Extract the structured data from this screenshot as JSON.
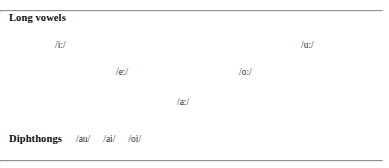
{
  "figure": {
    "long_vowels": {
      "heading": "Long vowels",
      "items": [
        {
          "symbol": "/i:/",
          "x": 55,
          "y": 40
        },
        {
          "symbol": "/u:/",
          "x": 301,
          "y": 40
        },
        {
          "symbol": "/e:/",
          "x": 116,
          "y": 67
        },
        {
          "symbol": "/o:/",
          "x": 239,
          "y": 67
        },
        {
          "symbol": "/a:/",
          "x": 177,
          "y": 97
        }
      ]
    },
    "diphthongs": {
      "heading": "Diphthongs",
      "items": [
        "/au/",
        "/ai/",
        "/oi/"
      ]
    },
    "rules": {
      "color": "#8e8e8e",
      "top_y": 2,
      "bottom_y": 152
    }
  }
}
